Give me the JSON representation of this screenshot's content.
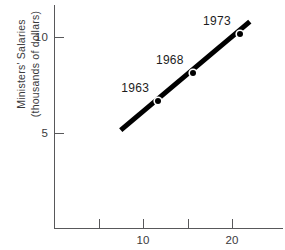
{
  "chart_data": {
    "type": "scatter",
    "title": "",
    "xlabel": "",
    "ylabel": "Ministers' Salaries",
    "ylabel_line2": "(thousands of dollars)",
    "xlim": [
      0,
      25.7
    ],
    "ylim": [
      0,
      11.7
    ],
    "x_ticks": [
      5,
      10,
      15,
      20
    ],
    "x_tick_labels": [
      "",
      "10",
      "",
      "20"
    ],
    "y_ticks": [
      5,
      10
    ],
    "y_tick_labels": [
      "5",
      "10"
    ],
    "grid": false,
    "legend": "none",
    "series": [
      {
        "name": "Ministers' Salaries",
        "line_endpoints": [
          {
            "x": 7.5,
            "y": 5.15
          },
          {
            "x": 22.0,
            "y": 10.8
          }
        ],
        "points": [
          {
            "label": "1963",
            "x": 11.7,
            "y": 6.65
          },
          {
            "label": "1968",
            "x": 15.6,
            "y": 8.1
          },
          {
            "label": "1973",
            "x": 20.9,
            "y": 10.15
          }
        ]
      }
    ],
    "colors": {
      "line": "#000000",
      "marker": "#000000",
      "axis": "#58585a",
      "text": "#3a3a3c",
      "label": "#1c1c1c",
      "background": "#ffffff"
    }
  }
}
